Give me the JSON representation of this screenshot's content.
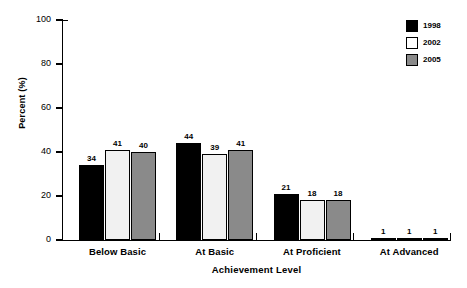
{
  "chart_data": {
    "type": "bar",
    "title": "",
    "subtitle": "",
    "xlabel": "Achievement Level",
    "ylabel": "Percent (%)",
    "categories": [
      "Below Basic",
      "At Basic",
      "At Proficient",
      "At Advanced"
    ],
    "series": [
      {
        "name": "1998",
        "color": "#000000",
        "values": [
          34,
          44,
          21,
          1
        ]
      },
      {
        "name": "2002",
        "color": "#ffffff",
        "values": [
          41,
          39,
          18,
          1
        ]
      },
      {
        "name": "2005",
        "color": "#8a8a8a",
        "values": [
          40,
          41,
          18,
          1
        ]
      }
    ],
    "ylim": [
      0,
      100
    ],
    "yticks": [
      0,
      20,
      40,
      60,
      80,
      100
    ],
    "ytick_labels": [
      "0",
      "20",
      "40",
      "60",
      "80",
      "100"
    ],
    "grid": false,
    "legend_position": "top-right",
    "data_labels_shown": true,
    "annotations": []
  },
  "legend": {
    "entries": [
      {
        "label": "1998",
        "swatch": "black-filled-square-icon"
      },
      {
        "label": "2002",
        "swatch": "white-filled-square-icon"
      },
      {
        "label": "2005",
        "swatch": "gray-filled-square-icon"
      }
    ]
  },
  "axes": {
    "y_title": "Percent (%)",
    "x_title": "Achievement Level",
    "y_tick_labels": [
      "100",
      "80",
      "60",
      "40",
      "20",
      "0"
    ],
    "x_group_labels": [
      "Below Basic",
      "At Basic",
      "At Proficient",
      "At Advanced"
    ]
  },
  "value_labels": {
    "below_basic": [
      "34",
      "41",
      "40"
    ],
    "at_basic": [
      "44",
      "39",
      "41"
    ],
    "at_proficient": [
      "21",
      "18",
      "18"
    ],
    "at_advanced": [
      "1",
      "1",
      "1"
    ]
  }
}
